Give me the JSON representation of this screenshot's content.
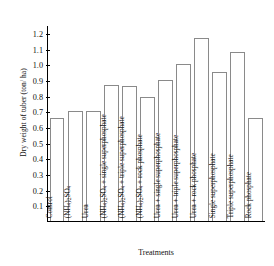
{
  "chart_data": {
    "type": "bar",
    "title": "",
    "xlabel": "Treatments",
    "ylabel": "Dry weight of tuber (ton/ ha)",
    "ylim": [
      0,
      1.25
    ],
    "ytick_labels": [
      "1.2",
      "1.1",
      "1.0",
      "0.9",
      "0.8",
      "0.7",
      "0.6",
      "0.5",
      "0.4",
      "0.3",
      "0.2",
      "0.1"
    ],
    "ytick_values": [
      1.2,
      1.1,
      1.0,
      0.9,
      0.8,
      0.7,
      0.6,
      0.5,
      0.4,
      0.3,
      0.2,
      0.1
    ],
    "grid": false,
    "legend": "none",
    "categories": [
      "Control",
      "(NH4)2SO4",
      "Urea",
      "(NH4)2SO4 + single superphosphate",
      "(NH4)2SO4 + triple superphosphate",
      "(NH4)2SO4 + rock phosphate",
      "Urea + single superphosphate",
      "Urea + triple superphosphate",
      "Urea + rock phosphate",
      "Single superphosphate",
      "Triple superphosphate",
      "Rock phosphate"
    ],
    "values": [
      0.66,
      0.7,
      0.7,
      0.87,
      0.86,
      0.79,
      0.9,
      1.0,
      1.17,
      0.95,
      1.08,
      0.66
    ],
    "bar_facecolor": "#ffffff",
    "bar_edgecolor": "#8a8a8a",
    "axis_color": "#000000"
  }
}
